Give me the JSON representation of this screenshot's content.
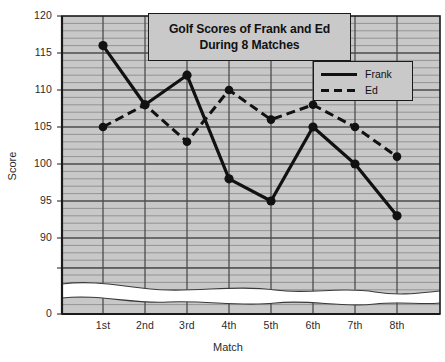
{
  "chart_data": {
    "type": "line",
    "title": "Golf Scores of Frank and Ed During 8 Matches",
    "title_line1": "Golf Scores of Frank and Ed",
    "title_line2": "During 8 Matches",
    "xlabel": "Match",
    "ylabel": "Score",
    "categories": [
      "1st",
      "2nd",
      "3rd",
      "4th",
      "5th",
      "6th",
      "7th",
      "8th"
    ],
    "series": [
      {
        "name": "Frank",
        "style": "solid",
        "values": [
          116,
          108,
          112,
          98,
          95,
          105,
          100,
          93
        ]
      },
      {
        "name": "Ed",
        "style": "dashed",
        "values": [
          105,
          108,
          103,
          110,
          106,
          108,
          105,
          101
        ]
      }
    ],
    "ylim": [
      90,
      120
    ],
    "yticks": [
      120,
      115,
      110,
      105,
      100,
      95,
      90
    ],
    "axis_break_tick": "0",
    "ytick_labels": [
      "120",
      "115",
      "110",
      "105",
      "100",
      "95",
      "90",
      "0"
    ],
    "grid": true,
    "grid_minor_step": 1,
    "grid_major_step": 5,
    "legend_position": "top-right",
    "legend_entries": [
      "Frank",
      "Ed"
    ],
    "has_axis_break": true,
    "colors": {
      "plot_background": "#c8c8c8",
      "line": "#111111",
      "gridline_minor": "#8a8a8a",
      "gridline_major": "#4a4a4a",
      "axis": "#1a1a1a",
      "text": "#2b2b2b",
      "box_background": "#c9c9c9"
    }
  }
}
